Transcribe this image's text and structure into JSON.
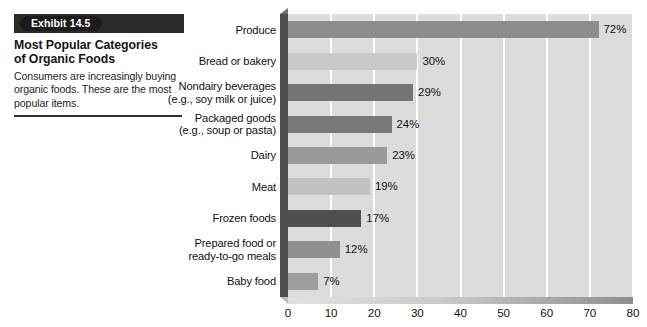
{
  "exhibit": {
    "badge": "Exhibit 14.5",
    "title_line1": "Most Popular Categories",
    "title_line2": "of Organic Foods",
    "description": "Consumers are increasingly buying organic foods. These are the most popular items."
  },
  "chart_data": {
    "type": "bar",
    "orientation": "horizontal",
    "title": "Most Popular Categories of Organic Foods",
    "xlabel": "",
    "ylabel": "",
    "xlim": [
      0,
      80
    ],
    "xticks": [
      0,
      10,
      20,
      30,
      40,
      50,
      60,
      70,
      80
    ],
    "grid": true,
    "legend": "none",
    "categories": [
      "Produce",
      "Bread or bakery",
      "Nondairy beverages (e.g., soy milk or juice)",
      "Packaged goods (e.g., soup or pasta)",
      "Dairy",
      "Meat",
      "Frozen foods",
      "Prepared food or ready-to-go meals",
      "Baby food"
    ],
    "values": [
      72,
      30,
      29,
      24,
      23,
      19,
      17,
      12,
      7
    ],
    "value_labels": [
      "72%",
      "30%",
      "29%",
      "24%",
      "23%",
      "19%",
      "17%",
      "12%",
      "7%"
    ],
    "bar_colors": [
      "#8c8c8c",
      "#c9c9c9",
      "#747474",
      "#787878",
      "#9a9a9a",
      "#c2c2c2",
      "#4f4f4f",
      "#8f8f8f",
      "#9e9e9e"
    ],
    "bars": [
      {
        "label_line1": "Produce",
        "label_line2": "",
        "value": 72,
        "value_label": "72%",
        "color": "#8c8c8c"
      },
      {
        "label_line1": "Bread or bakery",
        "label_line2": "",
        "value": 30,
        "value_label": "30%",
        "color": "#c9c9c9"
      },
      {
        "label_line1": "Nondairy beverages",
        "label_line2": "(e.g., soy milk or juice)",
        "value": 29,
        "value_label": "29%",
        "color": "#747474"
      },
      {
        "label_line1": "Packaged goods",
        "label_line2": "(e.g., soup or pasta)",
        "value": 24,
        "value_label": "24%",
        "color": "#787878"
      },
      {
        "label_line1": "Dairy",
        "label_line2": "",
        "value": 23,
        "value_label": "23%",
        "color": "#9a9a9a"
      },
      {
        "label_line1": "Meat",
        "label_line2": "",
        "value": 19,
        "value_label": "19%",
        "color": "#c2c2c2"
      },
      {
        "label_line1": "Frozen foods",
        "label_line2": "",
        "value": 17,
        "value_label": "17%",
        "color": "#4f4f4f"
      },
      {
        "label_line1": "Prepared food or",
        "label_line2": "ready-to-go meals",
        "value": 12,
        "value_label": "12%",
        "color": "#8f8f8f"
      },
      {
        "label_line1": "Baby food",
        "label_line2": "",
        "value": 7,
        "value_label": "7%",
        "color": "#9e9e9e"
      }
    ]
  },
  "colors": {
    "plot_background": "#dcdcdc",
    "gridline": "#ffffff",
    "banner": "#2b2b2b",
    "rule": "#333333"
  }
}
